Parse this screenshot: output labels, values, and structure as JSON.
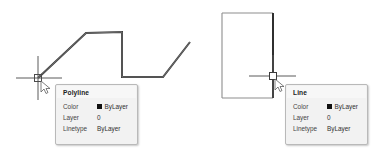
{
  "canvas": {
    "background_color": "#ffffff",
    "entity_color": "#3c3c3c",
    "entity_color_light": "#9a9a9a",
    "crosshair_color": "#4a4a4a",
    "objects": [
      {
        "name": "polyline",
        "type": "polyline",
        "vertices": "38,78 86,33 122,32 122,77 163,77 190,42"
      },
      {
        "name": "rectangle",
        "type": "rectangle",
        "x": 222,
        "y": 13,
        "width": 51,
        "height": 85,
        "selected_edge": "right"
      }
    ],
    "cursors": [
      {
        "name": "crosshair-left",
        "x": 38,
        "y": 78
      },
      {
        "name": "crosshair-right",
        "x": 273,
        "y": 76
      }
    ]
  },
  "tooltips": {
    "polyline": {
      "title": "Polyline",
      "rows": [
        {
          "key": "Color",
          "value": "ByLayer",
          "swatch_color": "#111111"
        },
        {
          "key": "Layer",
          "value": "0",
          "swatch_color": null
        },
        {
          "key": "Linetype",
          "value": "ByLayer",
          "swatch_color": null
        }
      ]
    },
    "line": {
      "title": "Line",
      "rows": [
        {
          "key": "Color",
          "value": "ByLayer",
          "swatch_color": "#111111"
        },
        {
          "key": "Layer",
          "value": "0",
          "swatch_color": null
        },
        {
          "key": "Linetype",
          "value": "ByLayer",
          "swatch_color": null
        }
      ]
    }
  }
}
